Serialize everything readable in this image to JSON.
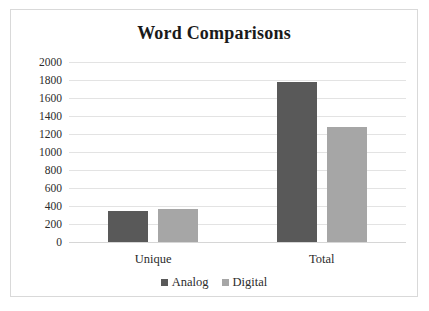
{
  "chart_data": {
    "type": "bar",
    "title": "Word Comparisons",
    "xlabel": "",
    "ylabel": "",
    "categories": [
      "Unique",
      "Total"
    ],
    "series": [
      {
        "name": "Analog",
        "color": "#595959",
        "values": [
          345,
          1775
        ]
      },
      {
        "name": "Digital",
        "color": "#a6a6a6",
        "values": [
          370,
          1280
        ]
      }
    ],
    "ylim": [
      0,
      2000
    ],
    "ytick_labels": [
      "2000",
      "1800",
      "1600",
      "1400",
      "1200",
      "1000",
      "800",
      "600",
      "400",
      "200",
      "0"
    ],
    "ytick_values": [
      2000,
      1800,
      1600,
      1400,
      1200,
      1000,
      800,
      600,
      400,
      200,
      0
    ],
    "grid": true,
    "grid_axis": "y",
    "legend_position": "bottom",
    "legend": [
      "Analog",
      "Digital"
    ],
    "background": "#ffffff",
    "border_color": "#d9d9d9",
    "gridline_color": "#e3e3e3"
  }
}
